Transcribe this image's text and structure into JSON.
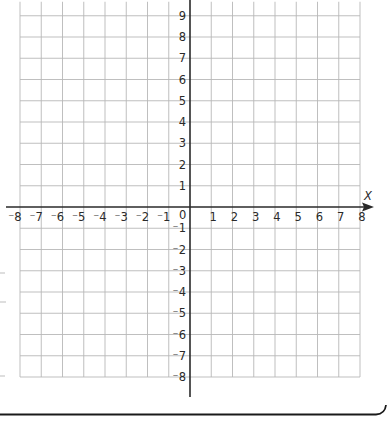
{
  "chart_data": {
    "type": "coordinate-grid",
    "title": "",
    "xlabel": "x",
    "ylabel": "",
    "xlim": [
      -8,
      8
    ],
    "ylim": [
      -8,
      9
    ],
    "grid": true,
    "x_ticks": [
      -8,
      -7,
      -6,
      -5,
      -4,
      -3,
      -2,
      -1,
      1,
      2,
      3,
      4,
      5,
      6,
      7,
      8
    ],
    "y_ticks": [
      9,
      8,
      7,
      6,
      5,
      4,
      3,
      2,
      1,
      -1,
      -2,
      -3,
      -4,
      -5,
      -6,
      -7,
      -8
    ],
    "origin_label": "0",
    "x_tick_labels": [
      "⁻8",
      "⁻7",
      "⁻6",
      "⁻5",
      "⁻4",
      "⁻3",
      "⁻2",
      "⁻1",
      "1",
      "2",
      "3",
      "4",
      "5",
      "6",
      "7",
      "8"
    ],
    "y_tick_labels": [
      "9",
      "8",
      "7",
      "6",
      "5",
      "4",
      "3",
      "2",
      "1",
      "⁻1",
      "⁻2",
      "⁻3",
      "⁻4",
      "⁻5",
      "⁻6",
      "⁻7",
      "⁻8"
    ],
    "series": []
  },
  "axes": {
    "x_axis_label": "X",
    "origin_label": "0"
  },
  "colors": {
    "grid": "#b8b8b8",
    "axis": "#2a2a2a",
    "frame": "#1a1a1a",
    "text": "#2a2a2a"
  }
}
